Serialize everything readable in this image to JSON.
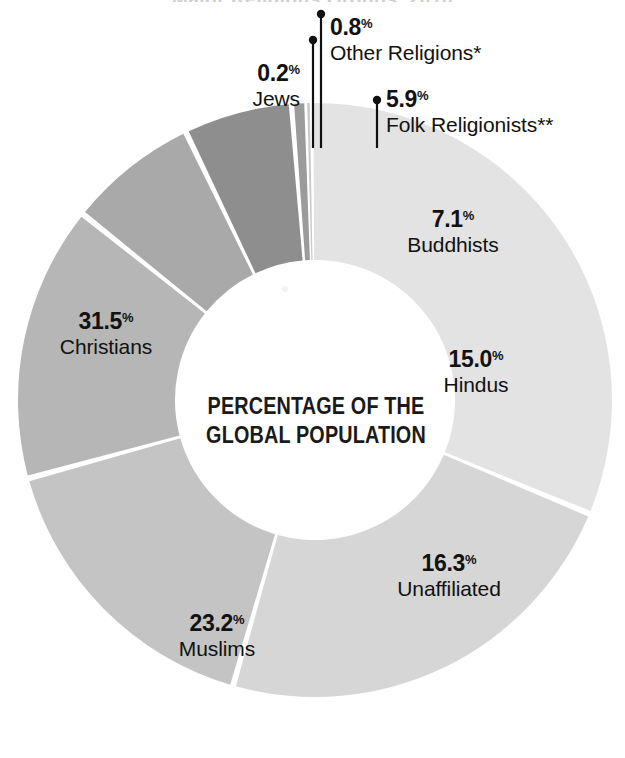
{
  "title_cut": "Major Religious Groups, 2010",
  "center_caption": {
    "line1": "PERCENTAGE OF THE",
    "line2": "GLOBAL POPULATION"
  },
  "colors": {
    "christians": "#e3e3e3",
    "jews": "#c9c9c9",
    "other_religions": "#9b9b9b",
    "folk_religionists": "#8e8e8e",
    "buddhists": "#a9a9a9",
    "hindus": "#b6b6b6",
    "unaffiliated": "#c4c4c4",
    "muslims": "#d6d6d6",
    "separator": "#ffffff",
    "leader_line": "#111111",
    "text": "#111111"
  },
  "chart_data": {
    "type": "pie",
    "title": "Major Religious Groups, 2010",
    "subtitle": "PERCENTAGE OF THE GLOBAL POPULATION",
    "unit": "%",
    "donut": true,
    "legend": "none",
    "categories": [
      "Christians",
      "Muslims",
      "Unaffiliated",
      "Hindus",
      "Buddhists",
      "Folk Religionists**",
      "Other Religions*",
      "Jews"
    ],
    "values": [
      31.5,
      23.2,
      16.3,
      15.0,
      7.1,
      5.9,
      0.8,
      0.2
    ],
    "slices": [
      {
        "label": "Christians",
        "value": 31.5,
        "value_text": "31.5",
        "color": "#e3e3e3"
      },
      {
        "label": "Muslims",
        "value": 23.2,
        "value_text": "23.2",
        "color": "#d6d6d6"
      },
      {
        "label": "Unaffiliated",
        "value": 16.3,
        "value_text": "16.3",
        "color": "#c4c4c4"
      },
      {
        "label": "Hindus",
        "value": 15.0,
        "value_text": "15.0",
        "color": "#b6b6b6"
      },
      {
        "label": "Buddhists",
        "value": 7.1,
        "value_text": "7.1",
        "color": "#a9a9a9"
      },
      {
        "label": "Folk Religionists**",
        "value": 5.9,
        "value_text": "5.9",
        "color": "#8e8e8e"
      },
      {
        "label": "Other Religions*",
        "value": 0.8,
        "value_text": "0.8",
        "color": "#9b9b9b"
      },
      {
        "label": "Jews",
        "value": 0.2,
        "value_text": "0.2",
        "color": "#c9c9c9"
      }
    ]
  },
  "labels": {
    "jews": {
      "pct": "0.2",
      "sym": "%",
      "name": "Jews"
    },
    "other": {
      "pct": "0.8",
      "sym": "%",
      "name": "Other Religions*"
    },
    "folk": {
      "pct": "5.9",
      "sym": "%",
      "name": "Folk Religionists**"
    },
    "buddhists": {
      "pct": "7.1",
      "sym": "%",
      "name": "Buddhists"
    },
    "hindus": {
      "pct": "15.0",
      "sym": "%",
      "name": "Hindus"
    },
    "unaffiliated": {
      "pct": "16.3",
      "sym": "%",
      "name": "Unaffiliated"
    },
    "muslims": {
      "pct": "23.2",
      "sym": "%",
      "name": "Muslims"
    },
    "christians": {
      "pct": "31.5",
      "sym": "%",
      "name": "Christians"
    }
  }
}
